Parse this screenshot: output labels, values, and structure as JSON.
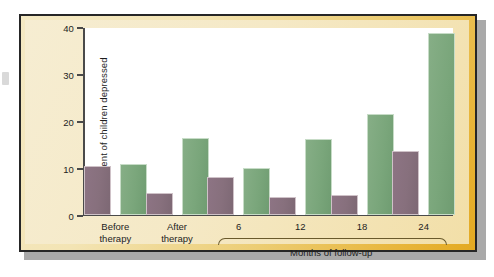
{
  "chart_data": {
    "type": "bar",
    "title": "",
    "xlabel": "Months of follow-up",
    "ylabel": "Percent of children depressed",
    "ylim": [
      0,
      40
    ],
    "yticks": [
      0,
      10,
      20,
      30,
      40
    ],
    "grid": false,
    "legend_position": "top-center",
    "categories": [
      "Before therapy",
      "After therapy",
      "6",
      "12",
      "18",
      "24"
    ],
    "category_lines": [
      [
        "Before",
        "therapy"
      ],
      [
        "After",
        "therapy"
      ],
      [
        "6",
        ""
      ],
      [
        "12",
        ""
      ],
      [
        "18",
        ""
      ],
      [
        "24",
        ""
      ]
    ],
    "series": [
      {
        "name": "Children in therapy group",
        "color": "#87707d",
        "values": [
          10.3,
          4.5,
          8.0,
          3.7,
          4.1,
          13.5
        ]
      },
      {
        "name": "Children in control group",
        "color": "#7aa67b",
        "values": [
          10.7,
          16.2,
          10.0,
          16.0,
          21.3,
          38.6
        ]
      }
    ],
    "bracket_label": "Months of follow-up",
    "bracket_categories": [
      "6",
      "12",
      "18",
      "24"
    ]
  },
  "legend": {
    "items": [
      {
        "label": "Children in therapy group",
        "swatch": "therapy"
      },
      {
        "label": "Children in control group",
        "swatch": "control"
      }
    ]
  },
  "axes": {
    "y_title": "Percent of children depressed",
    "y_tick_labels": [
      "0",
      "10",
      "20",
      "30",
      "40"
    ],
    "x_bracket_title": "Months of follow-up"
  },
  "colors": {
    "therapy_bar": "#87707d",
    "control_bar": "#7aa67b",
    "frame_gold": "#e8b63c",
    "panel_cream": "#f5e9c6",
    "frame_border": "#262626",
    "axis_line": "#4a4a4a",
    "plot_background": "#ffffff"
  }
}
